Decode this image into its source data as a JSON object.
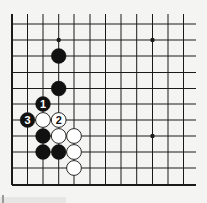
{
  "diagram": {
    "type": "go-board-partial",
    "view": "lower-left corner (left and bottom edges shown)",
    "grid": {
      "x": [
        12,
        27.5,
        43,
        58.7,
        74,
        90,
        105.5,
        121,
        136.7,
        152.5,
        168,
        183.5
      ],
      "y": [
        24,
        40,
        56,
        72.5,
        88.5,
        104,
        120,
        136,
        152,
        168,
        185
      ],
      "top_extend_to": 14,
      "right_extend_to": 196
    },
    "colors": {
      "background": "#f4f4f2",
      "line": "#1a1a1a",
      "black_stone": "#111111",
      "white_stone": "#ffffff"
    },
    "star_points": [
      {
        "col": 3,
        "row": 1
      },
      {
        "col": 9,
        "row": 1
      },
      {
        "col": 9,
        "row": 7
      }
    ],
    "stones": [
      {
        "color": "black",
        "col": 3,
        "row": 2,
        "label": ""
      },
      {
        "color": "black",
        "col": 3,
        "row": 4,
        "label": ""
      },
      {
        "color": "black",
        "col": 2,
        "row": 5,
        "label": "1"
      },
      {
        "color": "black",
        "col": 1,
        "row": 6,
        "label": "3"
      },
      {
        "color": "white",
        "col": 2,
        "row": 6,
        "label": ""
      },
      {
        "color": "white",
        "col": 3,
        "row": 6,
        "label": "2"
      },
      {
        "color": "black",
        "col": 2,
        "row": 7,
        "label": ""
      },
      {
        "color": "white",
        "col": 3,
        "row": 7,
        "label": ""
      },
      {
        "color": "white",
        "col": 4,
        "row": 7,
        "label": ""
      },
      {
        "color": "black",
        "col": 2,
        "row": 8,
        "label": ""
      },
      {
        "color": "black",
        "col": 3,
        "row": 8,
        "label": ""
      },
      {
        "color": "white",
        "col": 4,
        "row": 8,
        "label": ""
      },
      {
        "color": "white",
        "col": 4,
        "row": 9,
        "label": ""
      }
    ]
  }
}
